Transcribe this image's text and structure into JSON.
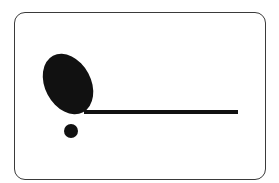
{
  "figure": {
    "colors": {
      "background": "#ffffff",
      "frame_border": "#3a3a3a",
      "shape_fill": "#111111"
    },
    "elements": [
      {
        "type": "ellipse",
        "name": "tilted-oval",
        "cx": 68,
        "cy": 84,
        "rx": 23,
        "ry": 32,
        "rotate": -28
      },
      {
        "type": "bar",
        "name": "horizontal-line",
        "x1": 84,
        "y1": 112,
        "x2": 238,
        "y2": 112,
        "thickness": 4
      },
      {
        "type": "dot",
        "name": "small-dot",
        "cx": 71,
        "cy": 131,
        "r": 7
      }
    ]
  }
}
